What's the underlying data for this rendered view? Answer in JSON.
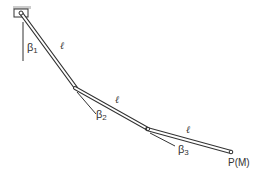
{
  "diagram": {
    "segments": [
      {
        "length_label": "ℓ",
        "angle_symbol": "β",
        "angle_index": "1"
      },
      {
        "length_label": "ℓ",
        "angle_symbol": "β",
        "angle_index": "2"
      },
      {
        "length_label": "ℓ",
        "angle_symbol": "β",
        "angle_index": "3"
      }
    ],
    "end_point_label": "P(M)",
    "colors": {
      "rod": "#333333",
      "support": "#cccccc",
      "fill": "#ffffff"
    }
  }
}
